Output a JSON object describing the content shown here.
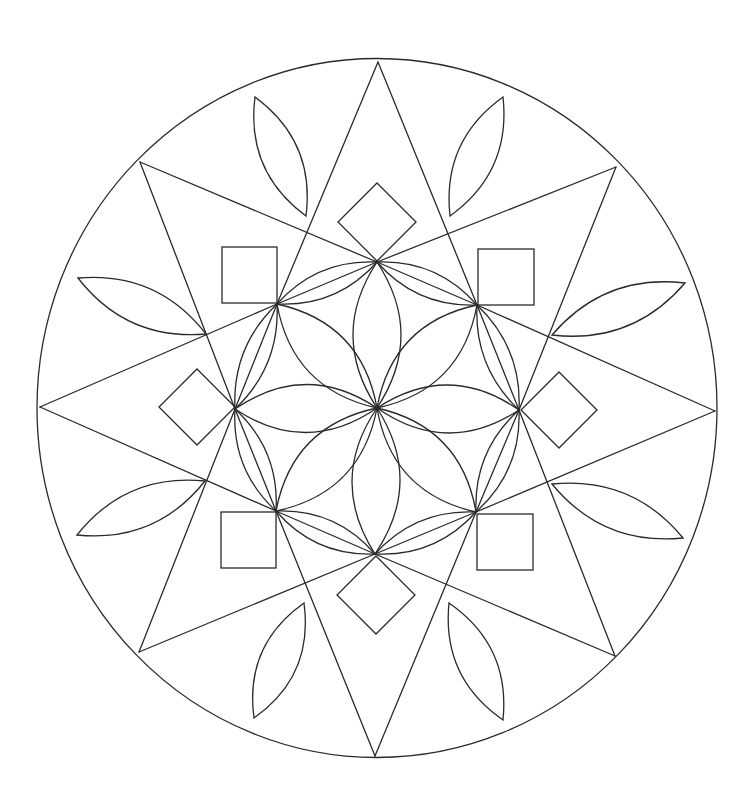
{
  "drawing": {
    "type": "mandala-line-art",
    "width": 743,
    "height": 803,
    "stroke_color": "#2a2a2a",
    "background_color": "#ffffff",
    "outer_circle": {
      "cx": 377,
      "cy": 408,
      "rx": 340,
      "ry": 349.5
    },
    "center": [
      377,
      408
    ],
    "star_tips": {
      "top": [
        378,
        62
      ],
      "top_right": [
        616,
        167
      ],
      "right": [
        715,
        411
      ],
      "bottom_right": [
        615,
        656
      ],
      "bottom": [
        375,
        756
      ],
      "bottom_left": [
        139,
        652
      ],
      "left": [
        40,
        407
      ],
      "top_left": [
        140,
        162
      ]
    },
    "inner_nodes": {
      "top": [
        377,
        262
      ],
      "upper_right": [
        477,
        305
      ],
      "right": [
        519,
        410
      ],
      "lower_right": [
        476,
        512
      ],
      "bottom": [
        375,
        554
      ],
      "lower_left": [
        276,
        511
      ],
      "left": [
        235,
        409
      ],
      "upper_left": [
        277,
        304
      ]
    },
    "star_lines": [
      [
        [
          378,
          62
        ],
        [
          277,
          304
        ]
      ],
      [
        [
          378,
          62
        ],
        [
          477,
          305
        ]
      ],
      [
        [
          140,
          162
        ],
        [
          377,
          262
        ]
      ],
      [
        [
          140,
          162
        ],
        [
          235,
          409
        ]
      ],
      [
        [
          616,
          167
        ],
        [
          377,
          262
        ]
      ],
      [
        [
          616,
          167
        ],
        [
          519,
          410
        ]
      ],
      [
        [
          40,
          407
        ],
        [
          277,
          304
        ]
      ],
      [
        [
          40,
          407
        ],
        [
          276,
          511
        ]
      ],
      [
        [
          715,
          411
        ],
        [
          477,
          305
        ]
      ],
      [
        [
          715,
          411
        ],
        [
          476,
          512
        ]
      ],
      [
        [
          139,
          652
        ],
        [
          235,
          409
        ]
      ],
      [
        [
          139,
          652
        ],
        [
          375,
          554
        ]
      ],
      [
        [
          615,
          656
        ],
        [
          519,
          410
        ]
      ],
      [
        [
          615,
          656
        ],
        [
          375,
          554
        ]
      ],
      [
        [
          375,
          756
        ],
        [
          276,
          511
        ]
      ],
      [
        [
          375,
          756
        ],
        [
          476,
          512
        ]
      ],
      [
        [
          277,
          304
        ],
        [
          377,
          262
        ]
      ],
      [
        [
          377,
          262
        ],
        [
          477,
          305
        ]
      ],
      [
        [
          477,
          305
        ],
        [
          519,
          410
        ]
      ],
      [
        [
          519,
          410
        ],
        [
          476,
          512
        ]
      ],
      [
        [
          476,
          512
        ],
        [
          375,
          554
        ]
      ],
      [
        [
          375,
          554
        ],
        [
          276,
          511
        ]
      ],
      [
        [
          276,
          511
        ],
        [
          235,
          409
        ]
      ],
      [
        [
          235,
          409
        ],
        [
          277,
          304
        ]
      ]
    ],
    "center_petals": [
      {
        "name": "petal-up",
        "from": [
          377,
          408
        ],
        "to": [
          377,
          262
        ],
        "bulge": 24
      },
      {
        "name": "petal-up-right",
        "from": [
          377,
          408
        ],
        "to": [
          477,
          305
        ],
        "bulge": 24
      },
      {
        "name": "petal-right",
        "from": [
          377,
          408
        ],
        "to": [
          519,
          410
        ],
        "bulge": 24
      },
      {
        "name": "petal-down-right",
        "from": [
          377,
          408
        ],
        "to": [
          476,
          512
        ],
        "bulge": 24
      },
      {
        "name": "petal-down",
        "from": [
          377,
          408
        ],
        "to": [
          375,
          554
        ],
        "bulge": 24
      },
      {
        "name": "petal-down-left",
        "from": [
          377,
          408
        ],
        "to": [
          276,
          511
        ],
        "bulge": 24
      },
      {
        "name": "petal-left",
        "from": [
          377,
          408
        ],
        "to": [
          235,
          409
        ],
        "bulge": 24
      },
      {
        "name": "petal-up-left",
        "from": [
          377,
          408
        ],
        "to": [
          277,
          304
        ],
        "bulge": 24
      }
    ],
    "ring_petals": [
      {
        "name": "ring-petal-1",
        "from": [
          377,
          262
        ],
        "to": [
          477,
          305
        ],
        "bulge": 13
      },
      {
        "name": "ring-petal-2",
        "from": [
          477,
          305
        ],
        "to": [
          519,
          410
        ],
        "bulge": 13
      },
      {
        "name": "ring-petal-3",
        "from": [
          519,
          410
        ],
        "to": [
          476,
          512
        ],
        "bulge": 13
      },
      {
        "name": "ring-petal-4",
        "from": [
          476,
          512
        ],
        "to": [
          375,
          554
        ],
        "bulge": 13
      },
      {
        "name": "ring-petal-5",
        "from": [
          375,
          554
        ],
        "to": [
          276,
          511
        ],
        "bulge": 13
      },
      {
        "name": "ring-petal-6",
        "from": [
          276,
          511
        ],
        "to": [
          235,
          409
        ],
        "bulge": 13
      },
      {
        "name": "ring-petal-7",
        "from": [
          235,
          409
        ],
        "to": [
          277,
          304
        ],
        "bulge": 13
      },
      {
        "name": "ring-petal-8",
        "from": [
          277,
          304
        ],
        "to": [
          377,
          262
        ],
        "bulge": 13
      }
    ],
    "outer_leaves": [
      {
        "name": "leaf-top-left",
        "from": [
          306,
          216
        ],
        "to": [
          255,
          97
        ],
        "bulge": 19
      },
      {
        "name": "leaf-top-right",
        "from": [
          450,
          216
        ],
        "to": [
          503,
          97
        ],
        "bulge": 19
      },
      {
        "name": "leaf-right-upper",
        "from": [
          552,
          335
        ],
        "to": [
          685,
          283
        ],
        "bulge": 19
      },
      {
        "name": "leaf-right-lower",
        "from": [
          552,
          484
        ],
        "to": [
          683,
          538
        ],
        "bulge": 19
      },
      {
        "name": "leaf-bottom-right",
        "from": [
          449,
          603
        ],
        "to": [
          503,
          720
        ],
        "bulge": 19
      },
      {
        "name": "leaf-bottom-left",
        "from": [
          304,
          603
        ],
        "to": [
          254,
          718
        ],
        "bulge": 19
      },
      {
        "name": "leaf-left-lower",
        "from": [
          205,
          481
        ],
        "to": [
          77,
          535
        ],
        "bulge": 19
      },
      {
        "name": "leaf-left-upper",
        "from": [
          206,
          334
        ],
        "to": [
          78,
          278
        ],
        "bulge": 19
      }
    ],
    "squares": [
      {
        "name": "square-upper-left",
        "x": 222,
        "y": 247,
        "w": 55,
        "h": 56
      },
      {
        "name": "square-upper-right",
        "x": 478,
        "y": 249,
        "w": 56,
        "h": 56
      },
      {
        "name": "square-lower-left",
        "x": 221,
        "y": 512,
        "w": 55,
        "h": 56
      },
      {
        "name": "square-lower-right",
        "x": 477,
        "y": 514,
        "w": 56,
        "h": 56
      }
    ],
    "diamonds": [
      {
        "name": "diamond-top",
        "cx": 377,
        "cy": 222,
        "r": 39
      },
      {
        "name": "diamond-right",
        "cx": 559,
        "cy": 410,
        "r": 38
      },
      {
        "name": "diamond-bottom",
        "cx": 376,
        "cy": 595,
        "r": 39
      },
      {
        "name": "diamond-left",
        "cx": 197,
        "cy": 407,
        "r": 38
      }
    ]
  }
}
